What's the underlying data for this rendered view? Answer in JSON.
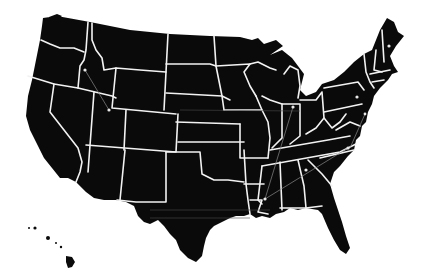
{
  "map": {
    "title": "United States map",
    "land_color": "#0a0a0a",
    "border_color": "#f2f2f2",
    "background_color": "#ffffff",
    "markers": [
      {
        "name": "idaho-marker",
        "x": 85,
        "y": 70
      },
      {
        "name": "nevada-utah-marker",
        "x": 109,
        "y": 110
      },
      {
        "name": "maine-marker",
        "x": 389,
        "y": 46
      },
      {
        "name": "pennsylvania-marker",
        "x": 357,
        "y": 97
      },
      {
        "name": "maryland-marker",
        "x": 365,
        "y": 114
      },
      {
        "name": "indiana-marker",
        "x": 293,
        "y": 107
      },
      {
        "name": "north-carolina-marker",
        "x": 348,
        "y": 148
      },
      {
        "name": "georgia-marker",
        "x": 306,
        "y": 170
      },
      {
        "name": "mississippi-marker",
        "x": 265,
        "y": 199
      }
    ]
  }
}
